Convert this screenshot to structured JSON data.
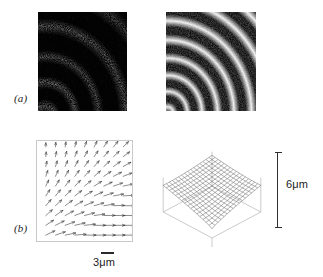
{
  "figure": {
    "background_color": "#ffffff",
    "panels": [
      {
        "id": "a",
        "label": "(a)",
        "description": "speckle-interferogram-pair"
      },
      {
        "id": "b",
        "label": "(b)",
        "description": "vector-field-and-surface-pair"
      }
    ]
  },
  "labels": {
    "panel_a": "(a)",
    "panel_b": "(b)"
  },
  "scales": {
    "horizontal": {
      "text": "3μm",
      "value": 3,
      "unit": "μm",
      "orientation": "horizontal",
      "attached_to": "vector-field-plot"
    },
    "vertical": {
      "text": "6μm",
      "value": 6,
      "unit": "μm",
      "orientation": "vertical",
      "attached_to": "surface-plot"
    }
  },
  "colors": {
    "background": "#ffffff",
    "speckle_dark": "#050505",
    "speckle_bright": "#f2f2f2",
    "mesh_line": "#4a4a4a",
    "box_line": "#b5b5b5",
    "arrow": "#3a3a3a",
    "text": "#1c1c1c",
    "scale_bar": "#2a2a2a"
  },
  "chart_data": [
    {
      "type": "heatmap",
      "name": "speckle-interferogram-left",
      "title": "",
      "description": "Low-contrast speckle correlation fringe pattern, mostly dark with sparse bright curved fringes in the upper-left and lower-left regions",
      "fringe_count": 4,
      "contrast": "low",
      "grid": false,
      "xlabel": "",
      "ylabel": "",
      "fringe_centre": [
        0.08,
        1.05
      ],
      "fringe_spacing_px": 21,
      "mean_intensity": 0.18
    },
    {
      "type": "heatmap",
      "name": "speckle-interferogram-right",
      "title": "",
      "description": "High-contrast speckle correlation fringe pattern with dense concentric curved fringes radiating from a centre near the lower-left corner",
      "fringe_count": 11,
      "contrast": "high",
      "grid": false,
      "xlabel": "",
      "ylabel": "",
      "fringe_centre": [
        0.02,
        1.02
      ],
      "fringe_spacing_px": 13,
      "mean_intensity": 0.5
    },
    {
      "type": "scatter",
      "name": "displacement-vector-field",
      "title": "",
      "description": "In-plane displacement vector field, arrows rotate from vertical at the upper-left to horizontal at the lower-right, magnitude increasing toward the lower-right",
      "grid_columns": 9,
      "grid_rows": 10,
      "xlabel": "",
      "ylabel": "",
      "xlim": [
        0,
        3
      ],
      "ylim": [
        0,
        3
      ],
      "scale_bar": "3μm",
      "arrow_direction_top_left_deg": 90,
      "arrow_direction_bottom_right_deg": 0,
      "magnitude_min": 0.35,
      "magnitude_max": 1.0
    },
    {
      "type": "area",
      "name": "out-of-plane-surface",
      "title": "",
      "description": "Three-dimensional wireframe mesh of the out-of-plane deformation inside a bounding box, the surface is high at the rear edges and dips steeply toward the front corner",
      "mesh_columns": 17,
      "mesh_rows": 17,
      "xlabel": "",
      "ylabel": "",
      "zlabel": "6μm",
      "zlim": [
        0,
        6
      ],
      "z_unit": "μm",
      "peak_location": "rear-corner",
      "minimum_location": "front-corner",
      "grid": true
    }
  ]
}
